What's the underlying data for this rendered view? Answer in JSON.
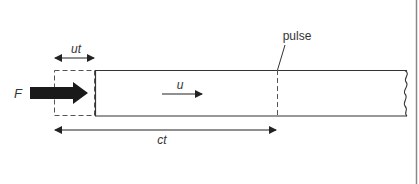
{
  "diagram": {
    "labels": {
      "force": "F",
      "piston_displacement": "ut",
      "particle_velocity": "u",
      "pulse": "pulse",
      "wave_distance": "ct"
    },
    "colors": {
      "stroke": "#333333",
      "force_arrow": "#1a1a1a",
      "border": "#888888",
      "background": "#ffffff"
    },
    "elements": [
      {
        "name": "force-arrow",
        "label": "F",
        "description": "thick black arrow pushing bar end"
      },
      {
        "name": "displaced-region",
        "label": "ut",
        "description": "dashed box showing original bar end displaced by ut"
      },
      {
        "name": "bar",
        "description": "long rectangular bar with broken (wavy) right end"
      },
      {
        "name": "velocity-arrow",
        "label": "u",
        "description": "particle velocity arrow inside bar"
      },
      {
        "name": "pulse-front",
        "label": "pulse",
        "description": "dashed vertical line marking wave front"
      },
      {
        "name": "wave-distance-arrow",
        "label": "ct",
        "description": "double arrow showing distance travelled by pulse"
      }
    ]
  }
}
